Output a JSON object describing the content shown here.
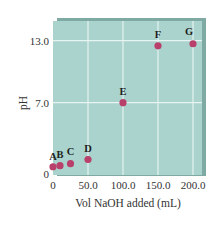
{
  "chart_data": {
    "type": "scatter",
    "title": "",
    "xlabel": "Vol NaOH added (mL)",
    "ylabel": "pH",
    "xlim": [
      0,
      200
    ],
    "ylim": [
      0,
      14
    ],
    "grid": true,
    "legend": null,
    "x_ticks": [
      "0",
      "50.0",
      "100.0",
      "150.0",
      "200.0"
    ],
    "y_ticks": [
      "0",
      "7.0",
      "13.0"
    ],
    "points": [
      {
        "label": "A",
        "x": 0,
        "y": 0.8
      },
      {
        "label": "B",
        "x": 10,
        "y": 0.9
      },
      {
        "label": "C",
        "x": 25,
        "y": 1.1
      },
      {
        "label": "D",
        "x": 50,
        "y": 1.5
      },
      {
        "label": "E",
        "x": 100,
        "y": 7.0
      },
      {
        "label": "F",
        "x": 150,
        "y": 12.5
      },
      {
        "label": "G",
        "x": 200,
        "y": 12.7
      }
    ],
    "colors": {
      "plot_background": "#a9d3cc",
      "grid": "#e8f4f1",
      "marker": "#b8406a"
    }
  }
}
